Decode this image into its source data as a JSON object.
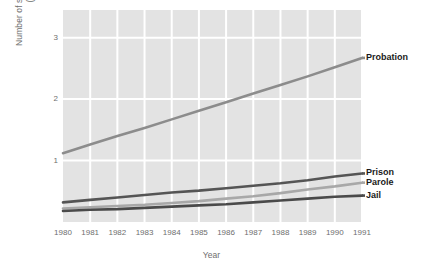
{
  "chart_data": {
    "type": "line",
    "title": "",
    "xlabel": "Year",
    "ylabel": "Number of sentenced offenders (millions)",
    "ylabel_line1": "Number of sentenced offenders",
    "ylabel_line2": "(millions)",
    "x": [
      1980,
      1981,
      1982,
      1983,
      1984,
      1985,
      1986,
      1987,
      1988,
      1989,
      1990,
      1991
    ],
    "xtick_labels": [
      "1980",
      "1981",
      "1982",
      "1983",
      "1984",
      "1985",
      "1986",
      "1987",
      "1988",
      "1989",
      "1990",
      "1991"
    ],
    "ytick_labels": [
      "1",
      "2",
      "3"
    ],
    "ytick_values": [
      1,
      2,
      3
    ],
    "xlim": [
      1980,
      1991
    ],
    "ylim": [
      0,
      3.45
    ],
    "grid": true,
    "legend_position": "right-inline",
    "plot_background": "#e3e3e3",
    "gridline_color": "#ffffff",
    "series": [
      {
        "name": "Probation",
        "color": "#8c8c8c",
        "label_color": "#1a1a1a",
        "values": [
          1.12,
          1.26,
          1.4,
          1.53,
          1.67,
          1.81,
          1.95,
          2.09,
          2.23,
          2.37,
          2.52,
          2.67
        ]
      },
      {
        "name": "Prison",
        "color": "#555555",
        "label_color": "#1a1a1a",
        "values": [
          0.32,
          0.36,
          0.4,
          0.44,
          0.48,
          0.51,
          0.55,
          0.59,
          0.63,
          0.68,
          0.74,
          0.79
        ]
      },
      {
        "name": "Parole",
        "color": "#a8a8a8",
        "label_color": "#1a1a1a",
        "values": [
          0.22,
          0.24,
          0.26,
          0.28,
          0.31,
          0.34,
          0.38,
          0.42,
          0.47,
          0.53,
          0.58,
          0.64
        ]
      },
      {
        "name": "Jail",
        "color": "#4a4a4a",
        "label_color": "#1a1a1a",
        "values": [
          0.18,
          0.2,
          0.21,
          0.23,
          0.25,
          0.27,
          0.29,
          0.32,
          0.35,
          0.38,
          0.41,
          0.43
        ]
      }
    ]
  }
}
